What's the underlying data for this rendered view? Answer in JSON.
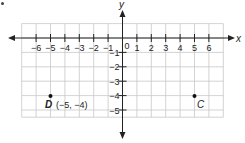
{
  "chart_data": {
    "type": "scatter",
    "title": "",
    "xlabel": "x",
    "ylabel": "y",
    "xlim": [
      -6.5,
      6.5
    ],
    "ylim": [
      -5.5,
      1
    ],
    "grid": true,
    "x_ticks": [
      -6,
      -5,
      -4,
      -3,
      -2,
      -1,
      1,
      2,
      3,
      4,
      5,
      6
    ],
    "y_ticks": [
      -1,
      -2,
      -3,
      -4,
      -5
    ],
    "origin_label": "0",
    "points": [
      {
        "name": "D",
        "x": -5,
        "y": -4,
        "label": "D (−5, −4)"
      },
      {
        "name": "C",
        "x": 5,
        "y": -4,
        "label": "C"
      }
    ]
  },
  "labels": {
    "x_axis": "x",
    "y_axis": "y",
    "origin": "0",
    "point_d_name": "D",
    "point_d_coords": "(−5, −4)",
    "point_c_name": "C"
  },
  "colors": {
    "grid": "#c8c8c8",
    "axis": "#222222",
    "point": "#111111"
  }
}
